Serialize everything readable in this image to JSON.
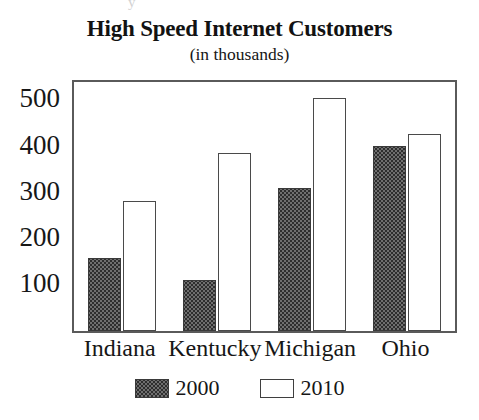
{
  "artifact": {
    "top_mark": "y"
  },
  "chart_data": {
    "type": "bar",
    "title": "High Speed Internet Customers",
    "subtitle": "(in thousands)",
    "xlabel": "",
    "ylabel": "",
    "ylim": [
      0,
      540
    ],
    "yticks": [
      100,
      200,
      300,
      400,
      500
    ],
    "ytick_labels": [
      "100",
      "200",
      "300",
      "400",
      "500"
    ],
    "grid": false,
    "legend_position": "bottom",
    "categories": [
      "Indiana",
      "Kentucky",
      "Michigan",
      "Ohio"
    ],
    "series": [
      {
        "name": "2000",
        "values": [
          158,
          110,
          310,
          402
        ],
        "color": "#6f6f6f",
        "fill": "stippled"
      },
      {
        "name": "2010",
        "values": [
          283,
          385,
          505,
          428
        ],
        "color": "#ffffff",
        "fill": "empty"
      }
    ]
  }
}
